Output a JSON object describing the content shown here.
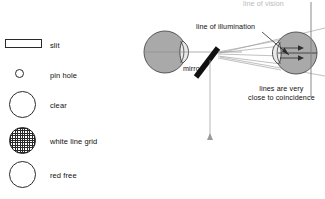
{
  "legend": {
    "items": [
      {
        "label": "slit",
        "icon": "slit-rectangle-icon"
      },
      {
        "label": "pin hole",
        "icon": "pinhole-circle-icon"
      },
      {
        "label": "clear",
        "icon": "clear-circle-icon"
      },
      {
        "label": "white line grid",
        "icon": "grid-circle-icon"
      },
      {
        "label": "red free",
        "icon": "red-free-circle-icon"
      }
    ]
  },
  "diagram": {
    "labels": {
      "illumination": "line of illumination",
      "mirror": "mirror",
      "coincidence_line1": "lines are very",
      "coincidence_line2": "close to coincidence",
      "top_cropped": "line of vision"
    },
    "parts": {
      "left_eye": "observer-eye",
      "right_eye": "patient-eye",
      "mirror_bar": "mirror",
      "rays": "illumination-rays"
    },
    "colors": {
      "eye_fill": "#a8a8a8",
      "mirror": "#111111",
      "ray": "#9a9a9a",
      "axis": "#8d8d8d",
      "text": "#111111"
    }
  }
}
